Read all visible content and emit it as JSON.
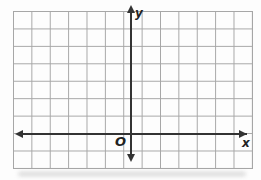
{
  "figure": {
    "type": "empty-coordinate-plane",
    "labels": {
      "y_axis": "y",
      "x_axis": "x",
      "origin": "O"
    },
    "grid": {
      "columns": 13,
      "rows": 9,
      "rows_above_x_axis": 7,
      "rows_below_x_axis": 2,
      "grid_line_color": "#a6a6a6",
      "axis_color": "#333333",
      "label_color": "#222222",
      "background_color": "#fdfdfd"
    }
  }
}
